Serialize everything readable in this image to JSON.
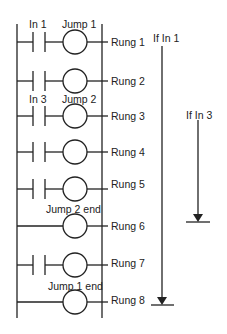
{
  "diagram": {
    "type": "ladder-logic",
    "rungs": [
      {
        "label": "Rung 1",
        "y": 42,
        "contact": true,
        "contact_label": "In 1",
        "coil_label": "Jump 1"
      },
      {
        "label": "Rung 2",
        "y": 81,
        "contact": true,
        "contact_label": "",
        "coil_label": ""
      },
      {
        "label": "Rung 3",
        "y": 116,
        "contact": true,
        "contact_label": "In 3",
        "coil_label": "Jump 2"
      },
      {
        "label": "Rung 4",
        "y": 152,
        "contact": true,
        "contact_label": "",
        "coil_label": ""
      },
      {
        "label": "Rung 5",
        "y": 189,
        "contact": true,
        "contact_label": "",
        "coil_label": ""
      },
      {
        "label": "Rung 6",
        "y": 226,
        "contact": false,
        "contact_label": "",
        "coil_label": "Jump 2 end"
      },
      {
        "label": "Rung 7",
        "y": 265,
        "contact": true,
        "contact_label": "",
        "coil_label": ""
      },
      {
        "label": "Rung 8",
        "y": 302,
        "contact": false,
        "contact_label": "",
        "coil_label": "Jump 1 end"
      }
    ],
    "arrows": [
      {
        "label": "If In 1",
        "x": 162,
        "y_start": 46,
        "y_end": 305
      },
      {
        "label": "If In 3",
        "x": 198,
        "y_start": 120,
        "y_end": 222
      }
    ]
  },
  "labels": {
    "in1": "In 1",
    "jump1": "Jump 1",
    "in3": "In 3",
    "jump2": "Jump 2",
    "jump2end": "Jump 2 end",
    "jump1end": "Jump 1 end",
    "rung1": "Rung 1",
    "rung2": "Rung 2",
    "rung3": "Rung 3",
    "rung4": "Rung 4",
    "rung5": "Rung 5",
    "rung6": "Rung 6",
    "rung7": "Rung 7",
    "rung8": "Rung 8",
    "if_in1": "If In 1",
    "if_in3": "If In 3"
  }
}
